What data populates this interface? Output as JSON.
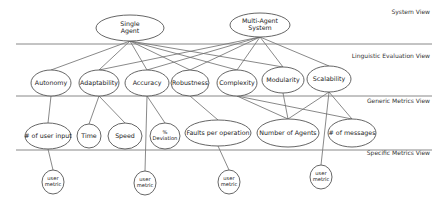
{
  "views": [
    {
      "id": "system",
      "label": "System View",
      "y": 14
    },
    {
      "id": "linguistic",
      "label": "Linguistic Evaluation View",
      "y": 58
    },
    {
      "id": "generic",
      "label": "Generic Metrics View",
      "y": 103
    },
    {
      "id": "specific",
      "label": "Specific Metrics View",
      "y": 155
    }
  ],
  "separators": [
    {
      "y": 44,
      "x1": 16,
      "x2": 432
    },
    {
      "y": 96,
      "x1": 16,
      "x2": 432
    },
    {
      "y": 150,
      "x1": 16,
      "x2": 432
    }
  ],
  "nodes": {
    "system": [
      {
        "id": "single",
        "lines": [
          "Single",
          "Agent"
        ],
        "cx": 130,
        "cy": 28,
        "rx": 34,
        "ry": 13
      },
      {
        "id": "multi",
        "lines": [
          "Multi-Agent",
          "System"
        ],
        "cx": 260,
        "cy": 25,
        "rx": 30,
        "ry": 12
      }
    ],
    "linguistic": [
      {
        "id": "autonomy",
        "lines": [
          "Autonomy"
        ],
        "cx": 51,
        "cy": 83,
        "rx": 20,
        "ry": 13
      },
      {
        "id": "adaptability",
        "lines": [
          "Adaptability"
        ],
        "cx": 99,
        "cy": 83,
        "rx": 20,
        "ry": 13
      },
      {
        "id": "accuracy",
        "lines": [
          "Accuracy"
        ],
        "cx": 147,
        "cy": 83,
        "rx": 22,
        "ry": 13
      },
      {
        "id": "robustness",
        "lines": [
          "Robustness"
        ],
        "cx": 190,
        "cy": 83,
        "rx": 19,
        "ry": 13
      },
      {
        "id": "complexity",
        "lines": [
          "Complexity"
        ],
        "cx": 237,
        "cy": 83,
        "rx": 20,
        "ry": 13
      },
      {
        "id": "modularity",
        "lines": [
          "Modularity"
        ],
        "cx": 283,
        "cy": 80,
        "rx": 21,
        "ry": 13
      },
      {
        "id": "scalability",
        "lines": [
          "Scalability"
        ],
        "cx": 329,
        "cy": 79,
        "rx": 22,
        "ry": 13
      }
    ],
    "generic": [
      {
        "id": "user_input",
        "lines": [
          "# of user input"
        ],
        "cx": 48,
        "cy": 136,
        "rx": 23,
        "ry": 13
      },
      {
        "id": "time",
        "lines": [
          "Time"
        ],
        "cx": 89,
        "cy": 136,
        "rx": 12,
        "ry": 12
      },
      {
        "id": "speed",
        "lines": [
          "Speed"
        ],
        "cx": 125,
        "cy": 136,
        "rx": 17,
        "ry": 13
      },
      {
        "id": "deviation",
        "lines": [
          "%",
          "Deviation"
        ],
        "cx": 165,
        "cy": 136,
        "rx": 15,
        "ry": 13
      },
      {
        "id": "faults",
        "lines": [
          "Faults per operation"
        ],
        "cx": 218,
        "cy": 133,
        "rx": 33,
        "ry": 13
      },
      {
        "id": "agents",
        "lines": [
          "Number of Agents"
        ],
        "cx": 288,
        "cy": 133,
        "rx": 31,
        "ry": 14
      },
      {
        "id": "messages",
        "lines": [
          "# of messages"
        ],
        "cx": 352,
        "cy": 133,
        "rx": 24,
        "ry": 14
      }
    ],
    "specific": [
      {
        "id": "um1",
        "lines": [
          "user",
          "metric"
        ],
        "cx": 53,
        "cy": 182,
        "rx": 11,
        "ry": 12
      },
      {
        "id": "um2",
        "lines": [
          "user",
          "metric"
        ],
        "cx": 145,
        "cy": 183,
        "rx": 11,
        "ry": 12
      },
      {
        "id": "um3",
        "lines": [
          "user",
          "metric"
        ],
        "cx": 229,
        "cy": 182,
        "rx": 11,
        "ry": 12
      },
      {
        "id": "um4",
        "lines": [
          "user",
          "metric"
        ],
        "cx": 321,
        "cy": 177,
        "rx": 11,
        "ry": 12
      }
    ]
  },
  "edges": [
    [
      "single",
      "autonomy"
    ],
    [
      "single",
      "adaptability"
    ],
    [
      "single",
      "accuracy"
    ],
    [
      "single",
      "robustness"
    ],
    [
      "single",
      "complexity"
    ],
    [
      "single",
      "modularity"
    ],
    [
      "multi",
      "adaptability"
    ],
    [
      "multi",
      "accuracy"
    ],
    [
      "multi",
      "robustness"
    ],
    [
      "multi",
      "complexity"
    ],
    [
      "multi",
      "modularity"
    ],
    [
      "multi",
      "scalability"
    ],
    [
      "autonomy",
      "user_input"
    ],
    [
      "adaptability",
      "time"
    ],
    [
      "adaptability",
      "speed"
    ],
    [
      "accuracy",
      "deviation"
    ],
    [
      "accuracy",
      "um2"
    ],
    [
      "robustness",
      "faults"
    ],
    [
      "complexity",
      "agents"
    ],
    [
      "complexity",
      "messages"
    ],
    [
      "modularity",
      "agents"
    ],
    [
      "scalability",
      "agents"
    ],
    [
      "scalability",
      "messages"
    ],
    [
      "scalability",
      "um4"
    ],
    [
      "user_input",
      "um1"
    ],
    [
      "faults",
      "um3"
    ]
  ]
}
